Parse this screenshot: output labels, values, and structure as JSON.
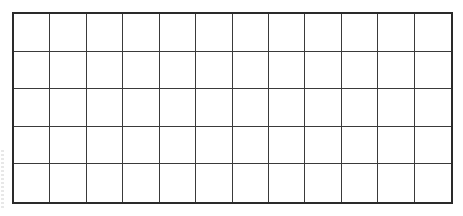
{
  "diagram": {
    "type": "empty-grid",
    "columns": 12,
    "rows": 5,
    "border_color": "#2a2a2a",
    "line_color": "#3a3a3a",
    "background": "#ffffff",
    "cells": []
  }
}
